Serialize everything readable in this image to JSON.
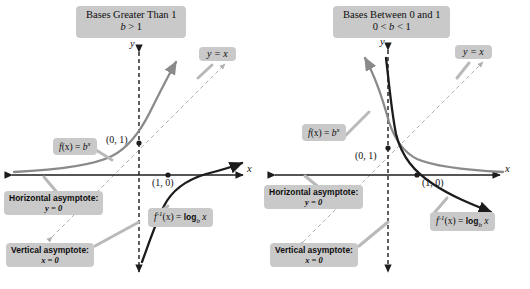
{
  "figure": {
    "panels": [
      {
        "id": "bases-greater-than-1",
        "title_line1": "Bases Greater Than 1",
        "title_line2_var": "b",
        "title_line2_op": ">",
        "title_line2_val": "1",
        "axis_x_label": "x",
        "axis_y_label": "y",
        "identity_line_label": "y = x",
        "exponential_label": {
          "fn": "f",
          "arg": "(x)",
          "eq": "=",
          "base": "b",
          "exp": "x"
        },
        "logarithm_label": {
          "fn": "f",
          "sup": "-1",
          "arg": "(x)",
          "eq": "=",
          "log": "log",
          "sub": "b",
          "var": "x"
        },
        "point_exponential_intercept": "(0, 1)",
        "point_logarithm_intercept": "(1, 0)",
        "asymptote_horizontal_title": "Horizontal asymptote:",
        "asymptote_horizontal_eq": "y = 0",
        "asymptote_vertical_title": "Vertical asymptote:",
        "asymptote_vertical_eq": "x = 0"
      },
      {
        "id": "bases-between-0-and-1",
        "title_line1": "Bases Between 0 and 1",
        "title_line2_lo": "0",
        "title_line2_op1": "<",
        "title_line2_var": "b",
        "title_line2_op2": "<",
        "title_line2_hi": "1",
        "axis_x_label": "x",
        "axis_y_label": "y",
        "identity_line_label": "y = x",
        "exponential_label": {
          "fn": "f",
          "arg": "(x)",
          "eq": "=",
          "base": "b",
          "exp": "x"
        },
        "logarithm_label": {
          "fn": "f",
          "sup": "-1",
          "arg": "(x)",
          "eq": "=",
          "log": "log",
          "sub": "b",
          "var": "x"
        },
        "point_exponential_intercept": "(0, 1)",
        "point_logarithm_intercept": "(1, 0)",
        "asymptote_horizontal_title": "Horizontal asymptote:",
        "asymptote_horizontal_eq": "y = 0",
        "asymptote_vertical_title": "Vertical asymptote:",
        "asymptote_vertical_eq": "x = 0"
      }
    ],
    "colors": {
      "exponential_curve": "#8a8a8a",
      "logarithm_curve": "#1c1c1c",
      "identity_line": "#b0b0b0",
      "axis": "#1c1c1c",
      "box_fill": "#c9c9c9",
      "leader_line": "#b9b9b9"
    }
  }
}
